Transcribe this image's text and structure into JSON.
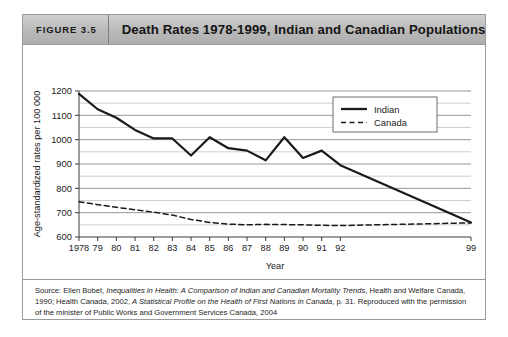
{
  "figure": {
    "number_label": "FIGURE 3.5",
    "title": "Death Rates 1978-1999, Indian and Canadian Populations"
  },
  "source": {
    "prefix": "Source: Ellen Bobet, ",
    "italic_1": "Inequalities in Health: A Comparison of Indian and Canadian Mortality Trends",
    "middle": ", Health and Welfare Canada, 1990; Health Canada, 2002, ",
    "italic_2": "A Statistical Profile on the Health of First Nations in Canada",
    "suffix": ", p. 31. Reproduced with the permission of the minister of Public Works and Government Services Canada, 2004"
  },
  "chart_data": {
    "type": "line",
    "title": "Death Rates 1978-1999, Indian and Canadian Populations",
    "xlabel": "Year",
    "ylabel": "Age-standardized rates per 100 000",
    "ylim": [
      600,
      1200
    ],
    "ytick_labels": [
      "600",
      "700",
      "800",
      "900",
      "1000",
      "1100",
      "1200"
    ],
    "ytick_values": [
      600,
      700,
      800,
      900,
      1000,
      1100,
      1200
    ],
    "gridline_values": [
      600,
      650,
      700,
      750,
      800,
      850,
      900,
      950,
      1000,
      1050,
      1100,
      1150,
      1200
    ],
    "grid": true,
    "categories": [
      "1978",
      "79",
      "80",
      "81",
      "82",
      "83",
      "84",
      "85",
      "86",
      "87",
      "88",
      "89",
      "90",
      "91",
      "92",
      "99"
    ],
    "x_values": [
      1978,
      1979,
      1980,
      1981,
      1982,
      1983,
      1984,
      1985,
      1986,
      1987,
      1988,
      1989,
      1990,
      1991,
      1992,
      1999
    ],
    "legend_position": "top-right",
    "series": [
      {
        "name": "Indian",
        "style": "solid",
        "color": "#1a1a1a",
        "values": [
          1188,
          1125,
          1090,
          1040,
          1005,
          1005,
          935,
          1010,
          965,
          955,
          915,
          1010,
          925,
          955,
          895,
          660
        ]
      },
      {
        "name": "Canada",
        "style": "dashed",
        "color": "#1a1a1a",
        "values": [
          745,
          733,
          722,
          712,
          702,
          690,
          672,
          660,
          653,
          650,
          652,
          651,
          650,
          648,
          647,
          658
        ]
      }
    ]
  }
}
